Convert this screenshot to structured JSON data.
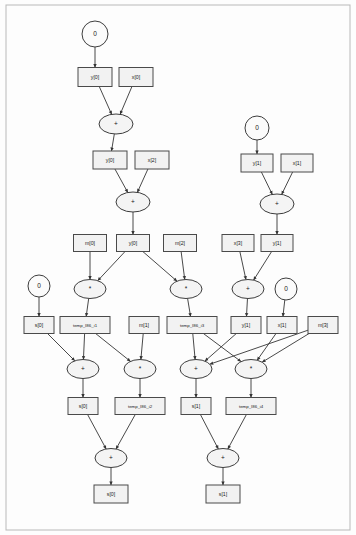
{
  "diagram": {
    "type": "dataflow-dag",
    "colors": {
      "box_fill": "#f2f2f2",
      "node_stroke": "#4a4a4a",
      "edge": "#343434",
      "background": "#ffffff"
    },
    "nodes": [
      {
        "id": "c0a",
        "label": "0",
        "shape": "circle",
        "x": 95,
        "y": 34,
        "rx": 13,
        "ry": 13
      },
      {
        "id": "y0a",
        "label": "y[0]",
        "shape": "box",
        "x": 95,
        "y": 77,
        "w": 34,
        "h": 19
      },
      {
        "id": "x0",
        "label": "x[0]",
        "shape": "box",
        "x": 136,
        "y": 77,
        "w": 34,
        "h": 19
      },
      {
        "id": "add1",
        "label": "+",
        "shape": "ellipse",
        "x": 116,
        "y": 124,
        "rx": 17,
        "ry": 10
      },
      {
        "id": "y0b",
        "label": "y[0]",
        "shape": "box",
        "x": 110,
        "y": 160,
        "w": 34,
        "h": 18
      },
      {
        "id": "x2",
        "label": "x[2]",
        "shape": "box",
        "x": 152,
        "y": 160,
        "w": 34,
        "h": 18
      },
      {
        "id": "add2",
        "label": "+",
        "shape": "ellipse",
        "x": 133,
        "y": 202,
        "rx": 17,
        "ry": 10
      },
      {
        "id": "c0b",
        "label": "0",
        "shape": "circle",
        "x": 257,
        "y": 128,
        "rx": 12,
        "ry": 12
      },
      {
        "id": "y1a",
        "label": "y[1]",
        "shape": "box",
        "x": 257,
        "y": 163,
        "w": 32,
        "h": 18
      },
      {
        "id": "x1a",
        "label": "x[1]",
        "shape": "box",
        "x": 297,
        "y": 163,
        "w": 32,
        "h": 18
      },
      {
        "id": "add3",
        "label": "+",
        "shape": "ellipse",
        "x": 277,
        "y": 204,
        "rx": 17,
        "ry": 10
      },
      {
        "id": "m0",
        "label": "m[0]",
        "shape": "box",
        "x": 90,
        "y": 243,
        "w": 33,
        "h": 17
      },
      {
        "id": "y0c",
        "label": "y[0]",
        "shape": "box",
        "x": 133,
        "y": 243,
        "w": 33,
        "h": 17
      },
      {
        "id": "m2",
        "label": "m[2]",
        "shape": "box",
        "x": 180,
        "y": 243,
        "w": 33,
        "h": 17
      },
      {
        "id": "x3",
        "label": "x[3]",
        "shape": "box",
        "x": 238,
        "y": 243,
        "w": 32,
        "h": 17
      },
      {
        "id": "y1b",
        "label": "y[1]",
        "shape": "box",
        "x": 277,
        "y": 243,
        "w": 32,
        "h": 17
      },
      {
        "id": "mul1",
        "label": "*",
        "shape": "ellipse",
        "x": 90,
        "y": 289,
        "rx": 16,
        "ry": 9.5
      },
      {
        "id": "mul2",
        "label": "*",
        "shape": "ellipse",
        "x": 186,
        "y": 289,
        "rx": 16,
        "ry": 9.5
      },
      {
        "id": "add4",
        "label": "+",
        "shape": "ellipse",
        "x": 248,
        "y": 289,
        "rx": 16,
        "ry": 9.5
      },
      {
        "id": "c0c",
        "label": "0",
        "shape": "circle",
        "x": 39,
        "y": 286,
        "rx": 11,
        "ry": 11
      },
      {
        "id": "c0d",
        "label": "0",
        "shape": "circle",
        "x": 286,
        "y": 289,
        "rx": 11,
        "ry": 11
      },
      {
        "id": "s0a",
        "label": "s[0]",
        "shape": "box",
        "x": 39,
        "y": 325,
        "w": 30,
        "h": 17
      },
      {
        "id": "t1",
        "label": "temp_I86_i1",
        "shape": "box",
        "x": 85,
        "y": 325,
        "w": 50,
        "h": 17
      },
      {
        "id": "m1",
        "label": "m[1]",
        "shape": "box",
        "x": 144,
        "y": 325,
        "w": 30,
        "h": 17
      },
      {
        "id": "t3",
        "label": "temp_I86_i3",
        "shape": "box",
        "x": 192,
        "y": 325,
        "w": 50,
        "h": 17
      },
      {
        "id": "y1c",
        "label": "y[1]",
        "shape": "box",
        "x": 246,
        "y": 325,
        "w": 30,
        "h": 17
      },
      {
        "id": "x1b",
        "label": "x[1]",
        "shape": "box",
        "x": 282,
        "y": 325,
        "w": 30,
        "h": 17
      },
      {
        "id": "m3",
        "label": "m[3]",
        "shape": "box",
        "x": 323,
        "y": 325,
        "w": 30,
        "h": 17
      },
      {
        "id": "add5",
        "label": "+",
        "shape": "ellipse",
        "x": 83,
        "y": 369,
        "rx": 16,
        "ry": 9.5
      },
      {
        "id": "mul3",
        "label": "*",
        "shape": "ellipse",
        "x": 140,
        "y": 369,
        "rx": 16,
        "ry": 9.5
      },
      {
        "id": "add6",
        "label": "+",
        "shape": "ellipse",
        "x": 196,
        "y": 369,
        "rx": 16,
        "ry": 9.5
      },
      {
        "id": "mul4",
        "label": "*",
        "shape": "ellipse",
        "x": 251,
        "y": 369,
        "rx": 16,
        "ry": 9.5
      },
      {
        "id": "s0b",
        "label": "s[0]",
        "shape": "box",
        "x": 83,
        "y": 406,
        "w": 30,
        "h": 17
      },
      {
        "id": "t2",
        "label": "temp_I86_i2",
        "shape": "box",
        "x": 140,
        "y": 406,
        "w": 50,
        "h": 17
      },
      {
        "id": "s1a",
        "label": "s[1]",
        "shape": "box",
        "x": 196,
        "y": 406,
        "w": 30,
        "h": 17
      },
      {
        "id": "t4",
        "label": "temp_I86_i4",
        "shape": "box",
        "x": 251,
        "y": 406,
        "w": 50,
        "h": 17
      },
      {
        "id": "add7",
        "label": "+",
        "shape": "ellipse",
        "x": 111,
        "y": 458,
        "rx": 16,
        "ry": 9.5
      },
      {
        "id": "add8",
        "label": "+",
        "shape": "ellipse",
        "x": 223,
        "y": 458,
        "rx": 16,
        "ry": 9.5
      },
      {
        "id": "s0out",
        "label": "s[0]",
        "shape": "box",
        "x": 111,
        "y": 494,
        "w": 34,
        "h": 18
      },
      {
        "id": "s1out",
        "label": "s[1]",
        "shape": "box",
        "x": 223,
        "y": 494,
        "w": 34,
        "h": 18
      }
    ],
    "edges": [
      {
        "from": "c0a",
        "to": "y0a"
      },
      {
        "from": "y0a",
        "to": "add1"
      },
      {
        "from": "x0",
        "to": "add1"
      },
      {
        "from": "add1",
        "to": "y0b"
      },
      {
        "from": "y0b",
        "to": "add2"
      },
      {
        "from": "x2",
        "to": "add2"
      },
      {
        "from": "add2",
        "to": "y0c"
      },
      {
        "from": "c0b",
        "to": "y1a"
      },
      {
        "from": "y1a",
        "to": "add3"
      },
      {
        "from": "x1a",
        "to": "add3"
      },
      {
        "from": "add3",
        "to": "y1b"
      },
      {
        "from": "m0",
        "to": "mul1"
      },
      {
        "from": "y0c",
        "to": "mul1"
      },
      {
        "from": "y0c",
        "to": "mul2"
      },
      {
        "from": "m2",
        "to": "mul2"
      },
      {
        "from": "x3",
        "to": "add4"
      },
      {
        "from": "y1b",
        "to": "add4"
      },
      {
        "from": "c0c",
        "to": "s0a"
      },
      {
        "from": "mul1",
        "to": "t1"
      },
      {
        "from": "mul2",
        "to": "t3"
      },
      {
        "from": "add4",
        "to": "y1c"
      },
      {
        "from": "c0d",
        "to": "x1b"
      },
      {
        "from": "s0a",
        "to": "add5"
      },
      {
        "from": "t1",
        "to": "add5"
      },
      {
        "from": "t1",
        "to": "mul3"
      },
      {
        "from": "m1",
        "to": "mul3"
      },
      {
        "from": "t3",
        "to": "add6"
      },
      {
        "from": "t3",
        "to": "mul4"
      },
      {
        "from": "y1c",
        "to": "add6"
      },
      {
        "from": "x1b",
        "to": "mul4"
      },
      {
        "from": "m3",
        "to": "mul4"
      },
      {
        "from": "m3",
        "to": "add6"
      },
      {
        "from": "add5",
        "to": "s0b"
      },
      {
        "from": "mul3",
        "to": "t2"
      },
      {
        "from": "add6",
        "to": "s1a"
      },
      {
        "from": "mul4",
        "to": "t4"
      },
      {
        "from": "s0b",
        "to": "add7"
      },
      {
        "from": "t2",
        "to": "add7"
      },
      {
        "from": "s1a",
        "to": "add8"
      },
      {
        "from": "t4",
        "to": "add8"
      },
      {
        "from": "add7",
        "to": "s0out"
      },
      {
        "from": "add8",
        "to": "s1out"
      }
    ]
  }
}
